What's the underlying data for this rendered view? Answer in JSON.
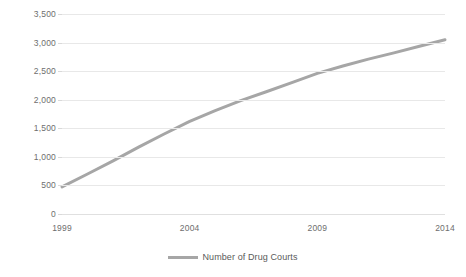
{
  "chart_data": {
    "type": "line",
    "title": "",
    "subtitle": "",
    "xlabel": "",
    "ylabel": "",
    "grid": true,
    "legend_position": "bottom",
    "xlim": [
      1999,
      2014
    ],
    "ylim": [
      0,
      3500
    ],
    "y_ticks": [
      0,
      500,
      1000,
      1500,
      2000,
      2500,
      3000,
      3500
    ],
    "y_tick_labels": [
      "0",
      "500",
      "1,000",
      "1,500",
      "2,000",
      "2,500",
      "3,000",
      "3,500"
    ],
    "x_ticks": [
      1999,
      2004,
      2009,
      2014
    ],
    "x_tick_labels": [
      "1999",
      "2004",
      "2009",
      "2014"
    ],
    "series": [
      {
        "name": "Number of Drug Courts",
        "color": "#a6a6a6",
        "line_width": 3,
        "x": [
          1999,
          2000,
          2001,
          2002,
          2003,
          2004,
          2005,
          2006,
          2007,
          2008,
          2009,
          2010,
          2011,
          2012,
          2013,
          2014
        ],
        "values": [
          475,
          700,
          930,
          1170,
          1400,
          1620,
          1810,
          1985,
          2140,
          2300,
          2460,
          2590,
          2710,
          2820,
          2935,
          3050
        ]
      }
    ]
  },
  "legend": {
    "entries": [
      {
        "label": "Number of Drug Courts",
        "color": "#a6a6a6"
      }
    ]
  },
  "colors": {
    "series": "#a6a6a6",
    "gridline": "#e8e8e8",
    "axis_text": "#6e6e6e",
    "legend_text": "#5a5a5a",
    "background": "#ffffff"
  }
}
